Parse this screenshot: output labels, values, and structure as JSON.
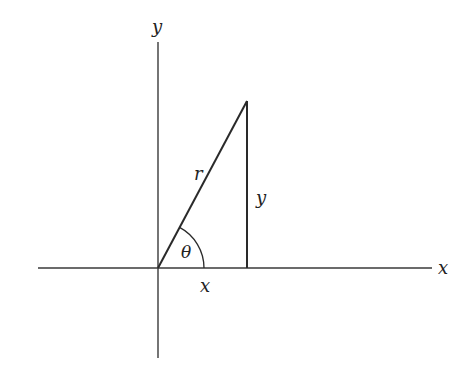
{
  "diagram": {
    "type": "polar-coordinates-right-triangle",
    "colors": {
      "line": "#2a2a2a",
      "axis": "#3a3a3a",
      "text": "#222222",
      "background": "#ffffff"
    },
    "labels": {
      "y_axis": "y",
      "x_axis": "x",
      "hypotenuse": "r",
      "opposite_leg": "y",
      "adjacent_leg": "x",
      "angle": "θ"
    },
    "geometry": {
      "origin": [
        158,
        268
      ],
      "apex": [
        247,
        101
      ],
      "foot": [
        247,
        268
      ],
      "x_axis_range": [
        38,
        432
      ],
      "y_axis_range": [
        42,
        358
      ],
      "angle_arc_radius": 46
    }
  }
}
